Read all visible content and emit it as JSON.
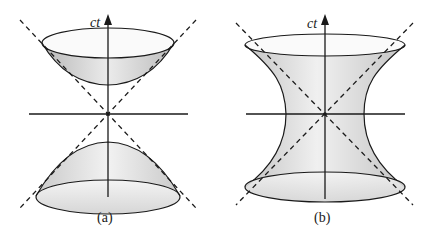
{
  "figure": {
    "panels": [
      {
        "id": "a",
        "caption": "(a)",
        "axis_label": "ct",
        "surface": "hyperboloid of two sheets",
        "origin": [
          108,
          114
        ]
      },
      {
        "id": "b",
        "caption": "(b)",
        "axis_label": "ct",
        "surface": "hyperboloid of one sheet",
        "origin": [
          325,
          114
        ]
      }
    ],
    "colors": {
      "stroke": "#1a1a1a",
      "fill_light": "#f2f2f2",
      "fill_dark": "#bdbdbd",
      "background": "#ffffff"
    }
  }
}
